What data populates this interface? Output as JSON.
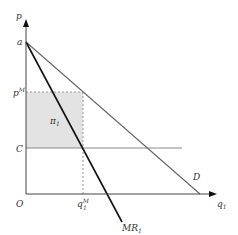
{
  "diagram": {
    "type": "monopoly-pricing",
    "axes": {
      "y_label": "p",
      "x_label": "q",
      "x_label_sub": "1",
      "origin_label": "O"
    },
    "y_ticks": {
      "a": "a",
      "pM": "p",
      "pM_sup": "M",
      "C": "C"
    },
    "x_ticks": {
      "qM": "q",
      "qM_sup": "M",
      "qM_sub": "1"
    },
    "curves": {
      "demand": "D",
      "mr": "MR",
      "mr_sub": "1"
    },
    "profit_area": {
      "label": "π",
      "label_sub": "1"
    },
    "colors": {
      "axis": "#444444",
      "demand": "#666666",
      "mr": "#111111",
      "cost_line": "#888888",
      "profit_fill": "#e3e3e3",
      "dashed": "#999999"
    }
  }
}
